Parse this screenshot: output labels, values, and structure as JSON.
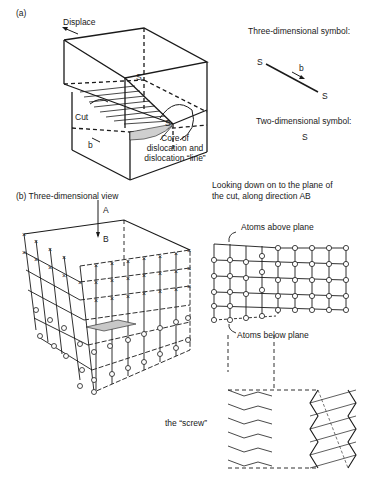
{
  "figure": {
    "panel_a": {
      "label": "(a)",
      "displace": "Displace",
      "cut": "Cut",
      "b": "b",
      "core_line1": "Core of",
      "core_line2": "dislocation and",
      "core_line3": "dislocation “line”",
      "s_top": "S",
      "s_core": "S",
      "three_d_title": "Three-dimensional symbol:",
      "three_d_s1": "S",
      "three_d_b": "b",
      "three_d_s2": "S",
      "two_d_title": "Two-dimensional symbol:",
      "two_d_s": "S"
    },
    "panel_b": {
      "label": "(b)  Three-dimensional view",
      "dir_a": "A",
      "dir_b": "B",
      "looking_line1": "Looking down on to the plane of",
      "looking_line2": "the cut, along direction AB",
      "atoms_above": "Atoms above plane",
      "atoms_below": "Atoms below plane",
      "screw": "the “screw”"
    },
    "legend": {
      "atom_above_symbol": "x",
      "atom_below_symbol": "o",
      "overlap_symbol": "⊗"
    }
  }
}
